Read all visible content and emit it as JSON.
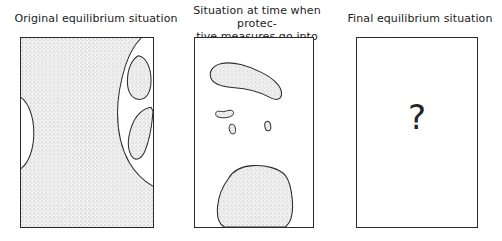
{
  "figure": {
    "title_absent": true,
    "panel_count": 3
  },
  "panels": [
    {
      "id": "panel-original",
      "caption": "Original equilibrium situation",
      "fill_description": "stippled-area",
      "regions": [
        {
          "name": "main-stippled-mass",
          "kind": "stippled"
        },
        {
          "name": "left-edge-white-lens",
          "kind": "white"
        },
        {
          "name": "right-white-channel",
          "kind": "white"
        },
        {
          "name": "upper-stippled-island",
          "kind": "stippled"
        },
        {
          "name": "lower-stippled-island",
          "kind": "stippled"
        }
      ]
    },
    {
      "id": "panel-protective-measures",
      "caption": "Situation at time when protec-\ntive measures go into force",
      "fill_description": "white-with-stippled-blobs",
      "regions": [
        {
          "name": "top-banana-blob",
          "kind": "stippled"
        },
        {
          "name": "small-hook-blob",
          "kind": "stippled"
        },
        {
          "name": "tiny-oval-blob-left",
          "kind": "stippled"
        },
        {
          "name": "tiny-oval-blob-right",
          "kind": "stippled"
        },
        {
          "name": "bottom-large-blob",
          "kind": "stippled"
        }
      ]
    },
    {
      "id": "panel-final",
      "caption": "Final equilibrium situation",
      "fill_description": "empty-with-question-mark",
      "question_mark": "?",
      "regions": []
    }
  ],
  "colors": {
    "ink": "#2a2a2a",
    "text": "#1b1b1b",
    "stipple_dot": "#8a8a8a",
    "background": "#ffffff"
  }
}
